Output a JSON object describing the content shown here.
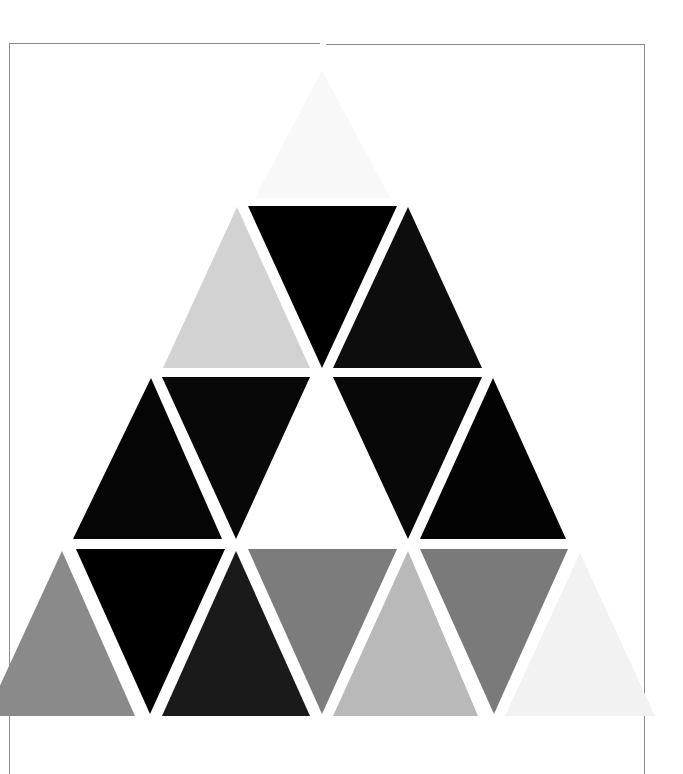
{
  "artwork": {
    "subject": "triangle mosaic in grayscale",
    "background_color": "#ffffff",
    "frame": {
      "color": "#8c8c8c",
      "top_y": 43,
      "left_x": 9,
      "right_x": 644,
      "bottom_y": 774,
      "top_gap": [
        320,
        326
      ]
    },
    "triangles": [
      {
        "row": 0,
        "dir": "up",
        "points": "322,70 255,198 390,198",
        "fill": "#f8f8f8"
      },
      {
        "row": 1,
        "dir": "up",
        "points": "237,207 163,368 310,368",
        "fill": "#d2d2d2"
      },
      {
        "row": 1,
        "dir": "down",
        "points": "248,206 397,206 322,368",
        "fill": "#000000"
      },
      {
        "row": 1,
        "dir": "up",
        "points": "408,207 333,368 482,368",
        "fill": "#0d0d0d"
      },
      {
        "row": 2,
        "dir": "up",
        "points": "151,378 73,539 222,539",
        "fill": "#050505"
      },
      {
        "row": 2,
        "dir": "down",
        "points": "162,377 310,377 236,539",
        "fill": "#080808"
      },
      {
        "row": 2,
        "dir": "down",
        "points": "333,377 482,377 408,539",
        "fill": "#080808"
      },
      {
        "row": 2,
        "dir": "up",
        "points": "493,378 420,539 566,539",
        "fill": "#030303"
      },
      {
        "row": 3,
        "dir": "up",
        "points": "62,551 -14,716 135,716",
        "fill": "#8a8a8a"
      },
      {
        "row": 3,
        "dir": "down",
        "points": "76,549 225,549 150,714",
        "fill": "#000000"
      },
      {
        "row": 3,
        "dir": "up",
        "points": "236,551 162,716 310,716",
        "fill": "#1a1a1a"
      },
      {
        "row": 3,
        "dir": "down",
        "points": "248,549 397,549 322,714",
        "fill": "#7c7c7c"
      },
      {
        "row": 3,
        "dir": "up",
        "points": "408,551 333,716 478,716",
        "fill": "#b9b9b9"
      },
      {
        "row": 3,
        "dir": "down",
        "points": "420,549 568,549 494,714",
        "fill": "#7a7a7a"
      },
      {
        "row": 3,
        "dir": "up",
        "points": "580,553 505,716 655,716",
        "fill": "#f2f2f2"
      }
    ]
  }
}
